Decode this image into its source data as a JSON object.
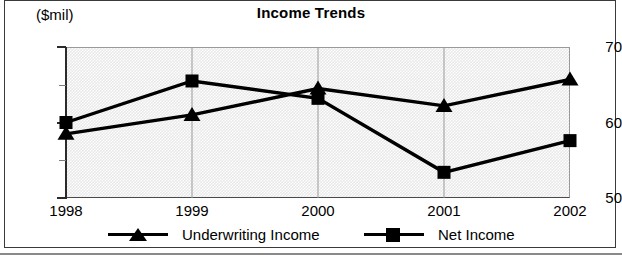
{
  "chart_data": {
    "type": "line",
    "title": "Income Trends",
    "unit_label": "($mil)",
    "xlabel": "",
    "ylabel": "",
    "categories": [
      "1998",
      "1999",
      "2000",
      "2001",
      "2002"
    ],
    "x": [
      1998,
      1999,
      2000,
      2001,
      2002
    ],
    "ylim": [
      50,
      70
    ],
    "y_ticks_major": [
      50,
      60,
      70
    ],
    "y_ticks_minor": [
      55,
      65
    ],
    "y_tick_labels": [
      "50",
      "60",
      "70"
    ],
    "grid": true,
    "legend_position": "bottom",
    "series": [
      {
        "name": "Underwriting Income",
        "marker": "triangle",
        "values": [
          58.5,
          61.0,
          64.5,
          62.2,
          65.7
        ]
      },
      {
        "name": "Net Income",
        "marker": "square",
        "values": [
          60.0,
          65.5,
          63.2,
          53.4,
          57.6
        ]
      }
    ]
  },
  "legend": {
    "entries": [
      {
        "label": "Underwriting Income",
        "marker": "triangle"
      },
      {
        "label": "Net Income",
        "marker": "square"
      }
    ]
  },
  "colors": {
    "series_line": "#000000",
    "plot_background": "#e9e9e9",
    "axis": "#2b2b2b",
    "gridline": "#9a9a9a",
    "frame": "#3a3a3a"
  }
}
